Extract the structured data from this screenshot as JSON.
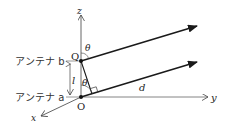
{
  "diagram": {
    "type": "antenna-geometry",
    "labels": {
      "antenna_b": "アンテナ b",
      "antenna_a": "アンテナ a",
      "point_q": "Q",
      "point_o": "O",
      "axis_z": "z",
      "axis_y": "y",
      "axis_x": "x",
      "theta_top": "θ",
      "theta_bottom": "θ",
      "length_l": "l",
      "distance_d": "d"
    },
    "colors": {
      "line": "#1a1a1a",
      "axis": "#555555",
      "text": "#222222"
    }
  }
}
